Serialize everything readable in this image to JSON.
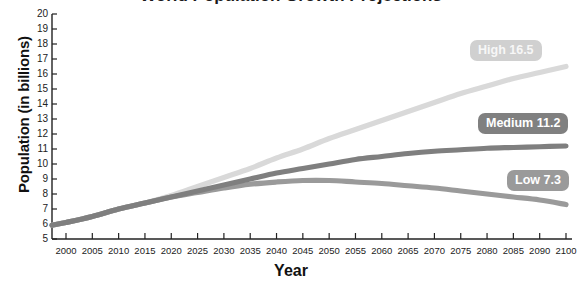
{
  "chart_data": {
    "type": "line",
    "title": "World Population Growth Projections",
    "xlabel": "Year",
    "ylabel": "Population (in billions)",
    "xlim": [
      1998,
      2100
    ],
    "ylim": [
      5,
      20
    ],
    "grid": false,
    "legend_position": "inline-right",
    "y_ticks": [
      20,
      19,
      18,
      17,
      16,
      15,
      14,
      13,
      12,
      11,
      10,
      9,
      8,
      7,
      6,
      5
    ],
    "x_ticks": [
      "2000",
      "2005",
      "2010",
      "2015",
      "2020",
      "2025",
      "2030",
      "2035",
      "2040",
      "2045",
      "2050",
      "2055",
      "2060",
      "2065",
      "2070",
      "2075",
      "2080",
      "2085",
      "2090",
      "2100"
    ],
    "x": [
      2000,
      2005,
      2010,
      2015,
      2020,
      2025,
      2030,
      2035,
      2040,
      2045,
      2050,
      2055,
      2060,
      2065,
      2070,
      2075,
      2080,
      2085,
      2090,
      2100
    ],
    "series": [
      {
        "name": "High",
        "end_label": "High 16.5",
        "end_value": 16.5,
        "color": "#d9d9d9",
        "values": [
          6.1,
          6.5,
          7.0,
          7.4,
          7.9,
          8.5,
          9.1,
          9.7,
          10.4,
          11.0,
          11.7,
          12.3,
          12.9,
          13.5,
          14.1,
          14.7,
          15.2,
          15.7,
          16.1,
          16.5
        ]
      },
      {
        "name": "Medium",
        "end_label": "Medium 11.2",
        "end_value": 11.2,
        "color": "#7f7f7f",
        "values": [
          6.1,
          6.5,
          7.0,
          7.4,
          7.8,
          8.2,
          8.6,
          9.0,
          9.4,
          9.7,
          10.0,
          10.3,
          10.5,
          10.7,
          10.85,
          10.95,
          11.05,
          11.1,
          11.15,
          11.2
        ]
      },
      {
        "name": "Low",
        "end_label": "Low 7.3",
        "end_value": 7.3,
        "color": "#9a9a9a",
        "values": [
          6.1,
          6.5,
          7.0,
          7.4,
          7.8,
          8.1,
          8.4,
          8.65,
          8.8,
          8.9,
          8.9,
          8.8,
          8.7,
          8.55,
          8.4,
          8.2,
          8.0,
          7.8,
          7.6,
          7.3
        ]
      }
    ]
  },
  "axis": {
    "y_title": "Population (in billions)",
    "x_title": "Year"
  },
  "legend": {
    "high": "High 16.5",
    "medium": "Medium 11.2",
    "low": "Low 7.3"
  },
  "colors": {
    "high": "#d9d9d9",
    "medium": "#7f7f7f",
    "low": "#9a9a9a",
    "axis": "#222222",
    "background": "#ffffff"
  }
}
